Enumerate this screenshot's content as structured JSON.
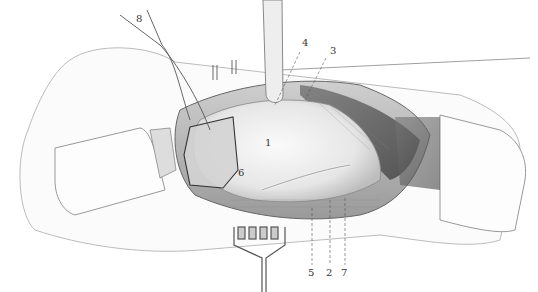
{
  "figure": {
    "labels": [
      {
        "id": "1",
        "text": "1",
        "x": 265,
        "y": 138
      },
      {
        "id": "2",
        "text": "2",
        "x": 328,
        "y": 273
      },
      {
        "id": "3",
        "text": "3",
        "x": 330,
        "y": 46
      },
      {
        "id": "4",
        "text": "4",
        "x": 302,
        "y": 38
      },
      {
        "id": "5",
        "text": "5",
        "x": 309,
        "y": 273
      },
      {
        "id": "6",
        "text": "6",
        "x": 238,
        "y": 170
      },
      {
        "id": "7",
        "text": "7",
        "x": 342,
        "y": 273
      },
      {
        "id": "8",
        "text": "8",
        "x": 136,
        "y": 16
      }
    ]
  }
}
